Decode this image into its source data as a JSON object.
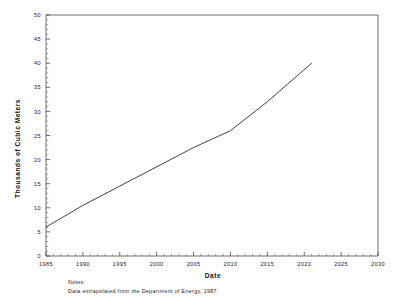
{
  "chart_data": {
    "type": "line",
    "title": "",
    "xlabel": "Date",
    "ylabel": "Thousands of Cubic Meters",
    "xlim": [
      1985,
      2030
    ],
    "ylim": [
      0,
      50
    ],
    "grid": false,
    "legend": null,
    "x_ticks": [
      1985,
      1990,
      1995,
      2000,
      2005,
      2010,
      2015,
      2020,
      2025,
      2030
    ],
    "x_tick_labels": [
      "1985",
      "1990",
      "1995",
      "2000",
      "2005",
      "2010",
      "2015",
      "2020",
      "2025",
      "2030"
    ],
    "y_ticks": [
      0,
      5,
      10,
      15,
      20,
      25,
      30,
      35,
      40,
      45,
      50
    ],
    "y_tick_labels": [
      "0",
      "5",
      "10",
      "15",
      "20",
      "25",
      "30",
      "35",
      "40",
      "45",
      "50"
    ],
    "x_minor_tick_interval": 1,
    "y_minor_tick_interval": 1,
    "series": [
      {
        "name": "Projected demand",
        "x": [
          1985,
          1990,
          1995,
          2000,
          2005,
          2010,
          2015,
          2021
        ],
        "values": [
          6.0,
          10.5,
          14.5,
          18.5,
          22.5,
          26.0,
          32.0,
          40.0
        ]
      }
    ]
  },
  "notes": {
    "heading": "Notes:",
    "body": "Data extrapolated from the Department of Energy, 1987."
  },
  "axis_titles": {
    "x": "Date",
    "y": "Thousands of Cubic Meters"
  }
}
